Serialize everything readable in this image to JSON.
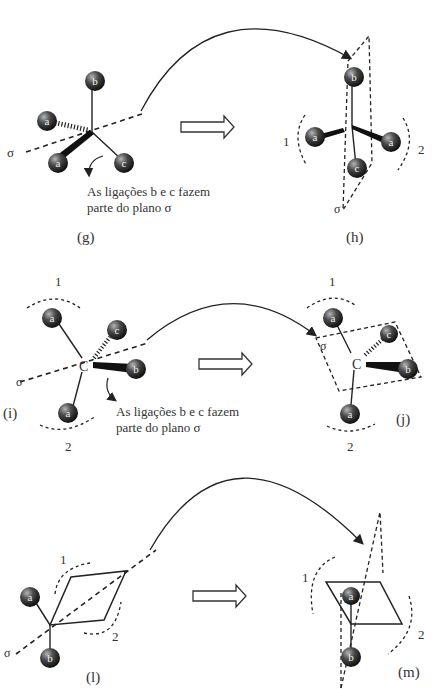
{
  "panels": {
    "g": {
      "label": "(g)",
      "sigma": "σ",
      "atoms": [
        "a",
        "a",
        "b",
        "c"
      ],
      "note_line1": "As ligações b e c fazem",
      "note_line2": "parte do plano σ"
    },
    "h": {
      "label": "(h)",
      "sigma": "σ",
      "atoms": [
        "a",
        "a",
        "b",
        "c"
      ],
      "region1": "1",
      "region2": "2"
    },
    "i": {
      "label": "(i)",
      "sigma": "σ",
      "center": "C",
      "atoms": [
        "a",
        "a",
        "b",
        "c"
      ],
      "region1": "1",
      "region2": "2",
      "note_line1": "As ligações b e c fazem",
      "note_line2": "parte do plano σ"
    },
    "j": {
      "label": "(j)",
      "sigma": "σ",
      "center": "C",
      "atoms": [
        "a",
        "a",
        "b",
        "c"
      ],
      "region1": "1",
      "region2": "2"
    },
    "l": {
      "label": "(l)",
      "sigma": "σ",
      "atoms": [
        "a",
        "b"
      ],
      "region1": "1",
      "region2": "2"
    },
    "m": {
      "label": "(m)",
      "atoms": [
        "a",
        "b"
      ],
      "region1": "1",
      "region2": "2"
    }
  },
  "colors": {
    "atom_fill": "#3a3a3a",
    "atom_highlight": "#9a9a9a",
    "line": "#222222",
    "text": "#333333"
  }
}
